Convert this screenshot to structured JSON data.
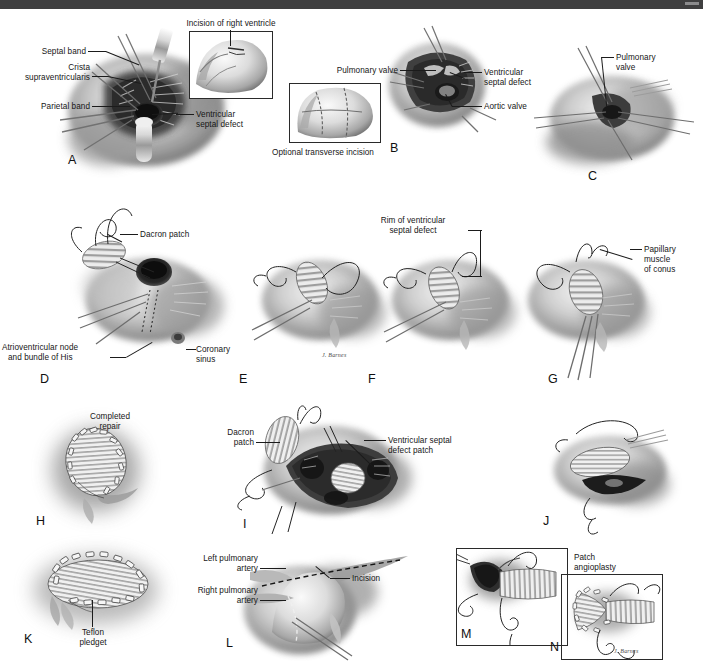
{
  "figure": {
    "background_color": "#ffffff",
    "ink_color": "#161616",
    "topbar_color": "#3f3f40",
    "style": "grayscale medical illustration"
  },
  "artist_signatures": [
    {
      "text": "J. Barnes",
      "panel": "E"
    },
    {
      "text": "J. Barnes",
      "panel": "N"
    }
  ],
  "panels": [
    {
      "letter": "A",
      "labels": [
        "Septal band",
        "Crista\nsupraventricularis",
        "Parietal band",
        "Ventricular\nseptal defect"
      ],
      "insets": [
        {
          "caption": "Incision of right ventricle",
          "caption_position": "top"
        }
      ]
    },
    {
      "letter": "B",
      "labels": [
        "Pulmonary valve",
        "Ventricular\nseptal defect",
        "Aortic valve"
      ],
      "insets": [
        {
          "caption": "Optional transverse incision",
          "caption_position": "bottom"
        }
      ]
    },
    {
      "letter": "C",
      "labels": [
        "Pulmonary\nvalve"
      ],
      "insets": []
    },
    {
      "letter": "D",
      "labels": [
        "Dacron patch",
        "Atrioventricular node\nand bundle of His",
        "Coronary\nsinus"
      ],
      "insets": []
    },
    {
      "letter": "E",
      "labels": [],
      "insets": []
    },
    {
      "letter": "F",
      "labels": [
        "Rim of ventricular\nseptal defect"
      ],
      "insets": []
    },
    {
      "letter": "G",
      "labels": [
        "Papillary\nmuscle\nof conus"
      ],
      "insets": []
    },
    {
      "letter": "H",
      "labels": [
        "Completed\nrepair"
      ],
      "insets": []
    },
    {
      "letter": "I",
      "labels": [
        "Dacron\npatch",
        "Ventricular septal\ndefect patch"
      ],
      "insets": []
    },
    {
      "letter": "J",
      "labels": [],
      "insets": []
    },
    {
      "letter": "K",
      "labels": [
        "Teflon\npledget"
      ],
      "insets": []
    },
    {
      "letter": "L",
      "labels": [
        "Left pulmonary\nartery",
        "Right pulmonary\nartery",
        "Incision"
      ],
      "insets": []
    },
    {
      "letter": "M",
      "labels": [],
      "insets": [
        {
          "caption": "",
          "caption_position": "none"
        }
      ]
    },
    {
      "letter": "N",
      "labels": [
        "Patch\nangioplasty"
      ],
      "insets": [
        {
          "caption": "",
          "caption_position": "none"
        }
      ]
    }
  ],
  "text": {
    "a_septal_band": "Septal band",
    "a_crista_1": "Crista",
    "a_crista_2": "supraventricularis",
    "a_parietal_band": "Parietal band",
    "a_vsd_1": "Ventricular",
    "a_vsd_2": "septal defect",
    "a_inset_caption": "Incision of right ventricle",
    "a_letter": "A",
    "b_pulm_valve": "Pulmonary valve",
    "b_vsd_1": "Ventricular",
    "b_vsd_2": "septal defect",
    "b_aortic_valve": "Aortic valve",
    "b_inset_caption": "Optional transverse incision",
    "b_letter": "B",
    "c_pulm_1": "Pulmonary",
    "c_pulm_2": "valve",
    "c_letter": "C",
    "d_dacron": "Dacron patch",
    "d_av_node_1": "Atrioventricular node",
    "d_av_node_2": "and bundle of His",
    "d_coronary_1": "Coronary",
    "d_coronary_2": "sinus",
    "d_letter": "D",
    "e_letter": "E",
    "e_signature": "J. Barnes",
    "f_rim_1": "Rim of ventricular",
    "f_rim_2": "septal defect",
    "f_letter": "F",
    "g_pap_1": "Papillary",
    "g_pap_2": "muscle",
    "g_pap_3": "of conus",
    "g_letter": "G",
    "h_completed_1": "Completed",
    "h_completed_2": "repair",
    "h_letter": "H",
    "i_dacron_1": "Dacron",
    "i_dacron_2": "patch",
    "i_vsd_patch_1": "Ventricular septal",
    "i_vsd_patch_2": "defect patch",
    "i_letter": "I",
    "j_letter": "J",
    "k_teflon_1": "Teflon",
    "k_teflon_2": "pledget",
    "k_letter": "K",
    "l_lpa_1": "Left pulmonary",
    "l_lpa_2": "artery",
    "l_rpa_1": "Right pulmonary",
    "l_rpa_2": "artery",
    "l_incision": "Incision",
    "l_letter": "L",
    "m_letter": "M",
    "n_patch_1": "Patch",
    "n_patch_2": "angioplasty",
    "n_letter": "N",
    "n_signature": "J. Barnes"
  }
}
